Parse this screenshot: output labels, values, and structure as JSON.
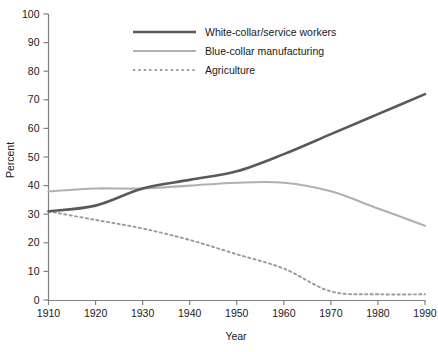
{
  "chart_data": {
    "type": "line",
    "title": "",
    "xlabel": "Year",
    "ylabel": "Percent",
    "x": [
      1910,
      1920,
      1930,
      1940,
      1950,
      1960,
      1970,
      1980,
      1990
    ],
    "xlim": [
      1910,
      1990
    ],
    "ylim": [
      0,
      100
    ],
    "xticks": [
      "1910",
      "1920",
      "1930",
      "1940",
      "1950",
      "1960",
      "1970",
      "1980",
      "1990"
    ],
    "yticks": [
      "0",
      "10",
      "20",
      "30",
      "40",
      "50",
      "60",
      "70",
      "80",
      "90",
      "100"
    ],
    "grid": false,
    "legend_position": "top-center",
    "series": [
      {
        "name": "White-collar/service workers",
        "style": "solid",
        "color": "#595959",
        "width": 2.6,
        "values": [
          31,
          33,
          39,
          42,
          45,
          51,
          58,
          65,
          72
        ]
      },
      {
        "name": "Blue-collar manufacturing",
        "style": "solid",
        "color": "#b0b0b0",
        "width": 2.1,
        "values": [
          38,
          39,
          39,
          40,
          41,
          41,
          38,
          32,
          26
        ]
      },
      {
        "name": "Agriculture",
        "style": "dotted",
        "color": "#9a9a9a",
        "width": 1.9,
        "values": [
          31,
          28,
          25,
          21,
          16,
          11,
          3,
          2,
          2
        ]
      }
    ]
  },
  "legend": {
    "items": [
      {
        "label": "White-collar/service workers"
      },
      {
        "label": "Blue-collar manufacturing"
      },
      {
        "label": "Agriculture"
      }
    ]
  },
  "axes": {
    "y_title": "Percent",
    "x_title": "Year"
  }
}
